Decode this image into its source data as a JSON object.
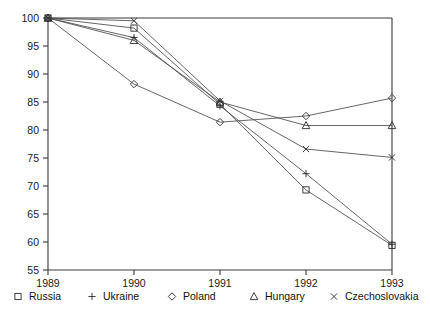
{
  "chart_data": {
    "type": "line",
    "title": "",
    "subtitle": "",
    "xlabel": "",
    "ylabel": "",
    "x": [
      "1989",
      "1990",
      "1991",
      "1992",
      "1993"
    ],
    "categories": [
      "1989",
      "1990",
      "1991",
      "1992",
      "1993"
    ],
    "xtick_labels": [
      "1989",
      "1990",
      "1991",
      "1992",
      "1993"
    ],
    "ytick_labels": [
      "100",
      "95",
      "90",
      "85",
      "80",
      "75",
      "70",
      "65",
      "60",
      "55"
    ],
    "ytick_values": [
      100,
      95,
      90,
      85,
      80,
      75,
      70,
      65,
      60,
      55
    ],
    "ylim": [
      55,
      100
    ],
    "xlim": [
      "1989",
      "1993"
    ],
    "grid": false,
    "legend_position": "bottom",
    "series": [
      {
        "name": "Russia",
        "marker": "square",
        "marker_glyph": "□",
        "values": [
          100,
          98.2,
          84.6,
          69.3,
          59.4
        ]
      },
      {
        "name": "Ukraine",
        "marker": "plus",
        "marker_glyph": "+",
        "values": [
          100,
          96.5,
          84.3,
          72.2,
          59.6
        ]
      },
      {
        "name": "Poland",
        "marker": "diamond",
        "marker_glyph": "◇",
        "values": [
          100,
          88.2,
          81.4,
          82.5,
          85.7
        ]
      },
      {
        "name": "Hungary",
        "marker": "triangle",
        "marker_glyph": "△",
        "values": [
          100,
          96.0,
          85.0,
          80.8,
          80.8
        ]
      },
      {
        "name": "Czechoslovakia",
        "marker": "cross",
        "marker_glyph": "×",
        "values": [
          100,
          99.5,
          85.2,
          76.6,
          75.1
        ]
      }
    ],
    "colors": {
      "line": "#4a4a4a",
      "marker": "#2b2b2b",
      "axis": "#3a3a3a",
      "text": "#111111",
      "background": "#ffffff"
    }
  },
  "legend": {
    "entries": [
      {
        "glyph": "□",
        "label": "Russia"
      },
      {
        "glyph": "+",
        "label": "Ukraine"
      },
      {
        "glyph": "◇",
        "label": "Poland"
      },
      {
        "glyph": "△",
        "label": "Hungary"
      },
      {
        "glyph": "×",
        "label": "Czechoslovakia"
      }
    ]
  }
}
